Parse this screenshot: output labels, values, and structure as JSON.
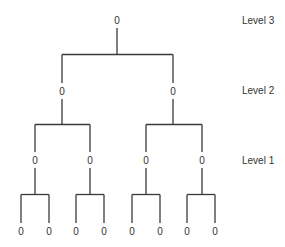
{
  "diagram": {
    "type": "binary-tree",
    "node_symbol": "0",
    "line_color": "#3a3a3a",
    "text_color": "#333333",
    "levels": [
      {
        "label": "Level 3",
        "y": 20
      },
      {
        "label": "Level 2",
        "y": 90
      },
      {
        "label": "Level 1",
        "y": 160
      }
    ],
    "nodes": {
      "level3": [
        {
          "x": 117,
          "y": 20
        }
      ],
      "level2": [
        {
          "x": 62,
          "y": 91
        },
        {
          "x": 173,
          "y": 91
        }
      ],
      "level1": [
        {
          "x": 35,
          "y": 160
        },
        {
          "x": 90,
          "y": 160
        },
        {
          "x": 146,
          "y": 160
        },
        {
          "x": 202,
          "y": 160
        }
      ],
      "leaves": [
        {
          "x": 21,
          "y": 231
        },
        {
          "x": 49,
          "y": 231
        },
        {
          "x": 76,
          "y": 231
        },
        {
          "x": 104,
          "y": 231
        },
        {
          "x": 132,
          "y": 231
        },
        {
          "x": 160,
          "y": 231
        },
        {
          "x": 187,
          "y": 231
        },
        {
          "x": 215,
          "y": 231
        }
      ]
    },
    "level_label_x": 242
  }
}
